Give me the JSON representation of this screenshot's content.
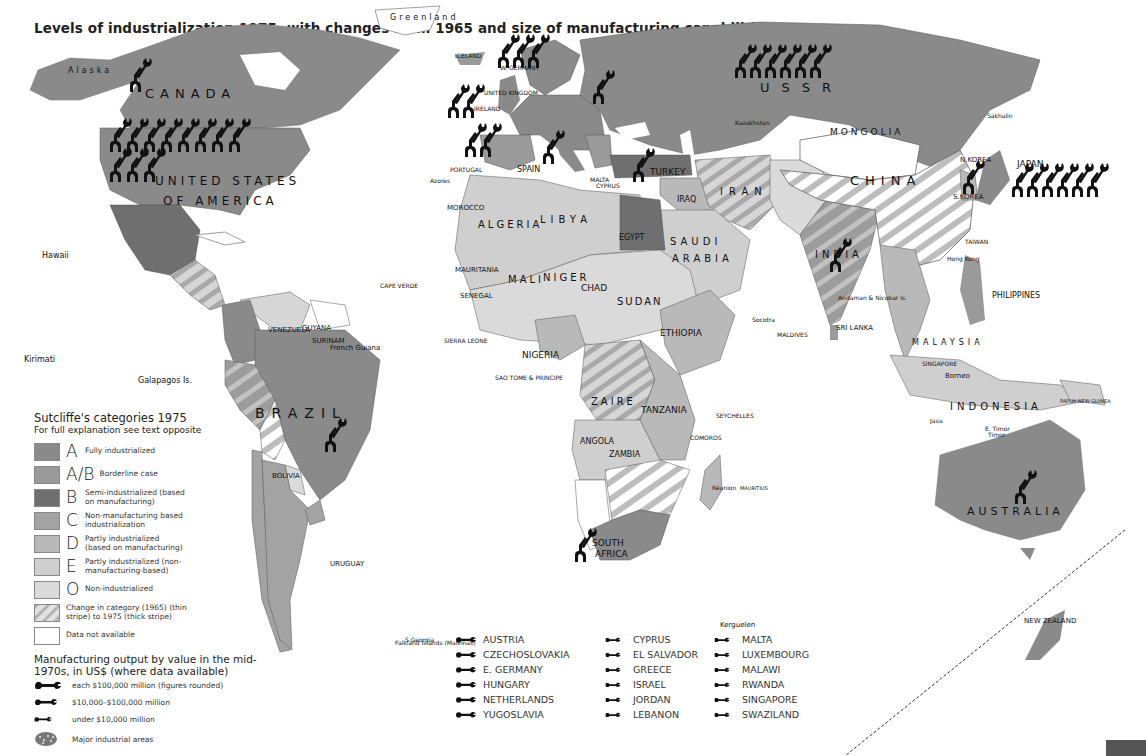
{
  "title": "Levels of industrialization 1975, with changes from 1965 and size of manufacturing capabilities",
  "colors": {
    "A": "#8a8a8a",
    "AB": "#9a9a9a",
    "B": "#6f6f6f",
    "C": "#a3a3a3",
    "D": "#b9b9b9",
    "E": "#cfcfcf",
    "O": "#dadada",
    "na": "#ffffff",
    "border": "#444444",
    "wrench": "#111111"
  },
  "map_labels": {
    "alaska": "Alaska",
    "canada": "CANADA",
    "greenland": "Greenland",
    "usa1": "UNITED STATES",
    "usa2": "OF AMERICA",
    "mexico": "MEXICO",
    "hawaii": "Hawaii",
    "kirimati": "Kirimati",
    "galapagos": "Galapagos Is.",
    "cuba": "CUBA",
    "bahamas": "BAHAMAS",
    "jamaica": "JAMAICA",
    "haiti": "HAITI",
    "dominican": "DOMINICAN REP.",
    "belize": "BELIZE",
    "honduras": "HONDURAS",
    "guatemala": "GUATEMALA",
    "el_salvador": "EL SALVADOR",
    "nicaragua": "NICARAGUA",
    "costa_rica": "COSTA RICA",
    "panama": "PANAMA",
    "virgin": "Virgin Is.",
    "antigua": "ANTIGUA & BARBUDA",
    "guadeloupe": "Guadeloupe",
    "dominica": "DOMINICA",
    "martinique": "Martinique",
    "st_lucia": "ST. LUCIA",
    "barbados": "BARBADOS",
    "st_vincent": "ST. VINCENT",
    "grenada": "GRENADA",
    "trinidad": "TRINIDAD & TOBAGO",
    "puerto_rico": "Puerto Rico",
    "venezuela": "VENEZUELA",
    "guyana": "GUYANA",
    "surinam": "SURINAM",
    "french_guiana": "French Guiana",
    "colombia": "COLOMBIA",
    "ecuador": "ECUADOR",
    "peru": "PERU",
    "brazil": "BRAZIL",
    "bolivia": "BOLIVIA",
    "paraguay": "PARAGUAY",
    "chile": "CHILE",
    "argentina": "ARGENTINA",
    "uruguay": "URUGUAY",
    "falklands": "Falkland Islands (Malvinas)",
    "s_georgia": "S.Georgia",
    "iceland": "ICELAND",
    "uk": "UNITED KINGDOM",
    "ireland": "IRELAND",
    "w_germany": "W. GERMANY",
    "norway": "NORWAY",
    "denmark": "DENMARK",
    "france": "FRANCE",
    "spain": "SPAIN",
    "portugal": "PORTUGAL",
    "italy": "ITALY",
    "greece": "GREECE",
    "malta": "MALTA",
    "cyprus": "CYPRUS",
    "azores": "Azores",
    "byelorussia": "Byelorussia",
    "ukraine": "Ukraine",
    "moldavia": "Moldavia",
    "ussr": "USSR",
    "kazakhstan": "Kazakhstan",
    "sakhalin": "Sakhalin",
    "mongolia": "MONGOLIA",
    "china": "CHINA",
    "n_korea": "N.KOREA",
    "s_korea": "S.KOREA",
    "japan": "JAPAN",
    "taiwan": "TAIWAN",
    "hong_kong": "Hong Kong",
    "turkey": "TURKEY",
    "syria": "SYRIA",
    "lebanon": "LEBANON",
    "israel": "ISRAEL",
    "jordan": "JORDAN",
    "iraq": "IRAQ",
    "iran": "IRAN",
    "kuwait": "KUWAIT",
    "bahrain": "BAHRAIN",
    "qatar": "QATAR",
    "saudi1": "SAUDI",
    "saudi2": "ARABIA",
    "oman": "OMAN",
    "yemen": "YEMEN",
    "afghanistan": "AFGHANISTAN",
    "pakistan": "PAKISTAN",
    "india": "INDIA",
    "nepal": "NEPAL",
    "bangladesh": "BANGLADESH",
    "myanmar": "MYANMAR",
    "thailand": "THAILAND",
    "vietnam": "VIETNAM",
    "cambodia": "CAMBODIA",
    "sri_lanka": "SRI LANKA",
    "maldives": "MALDIVES",
    "andaman": "Andaman & Nicobar Is.",
    "philippines": "PHILIPPINES",
    "malaysia": "MALAYSIA",
    "brunei": "BRUNEI",
    "singapore": "SINGAPORE",
    "borneo": "Borneo",
    "sumatra": "Sumatra",
    "java": "Java",
    "timor": "Timor",
    "e_timor": "E. Timor",
    "indonesia": "INDONESIA",
    "png": "PAPUA NEW GUINEA",
    "australia": "AUSTRALIA",
    "new_zealand": "NEW ZEALAND",
    "morocco": "MOROCCO",
    "canary": "Canary Isles",
    "w_sahara": "Western Sahara",
    "algeria": "ALGERIA",
    "libya": "LIBYA",
    "egypt": "EGYPT",
    "mauritania": "MAURITANIA",
    "mali": "MALI",
    "niger": "NIGER",
    "chad": "CHAD",
    "sudan": "SUDAN",
    "cape_verde": "CAPE VERDE",
    "senegal": "SENEGAL",
    "gambia": "GAMBIA",
    "guinea_bissau": "GUINEA BISSAU",
    "guinea": "GUINEA",
    "sierra_leone": "SIERRA LEONE",
    "liberia": "LIBERIA",
    "cote": "COTE D'IVOIRE",
    "ghana": "GHANA",
    "nigeria": "NIGERIA",
    "cameroon": "CAMEROON",
    "car": "CENTRAL AFRICAN REPUBLIC",
    "ethiopia": "ETHIOPIA",
    "eritrea": "Eritrea",
    "djibouti": "DJIBOUTI",
    "somalia": "SOMALIA",
    "socotra": "Socotra",
    "eq_guinea": "EQ. GUINEA",
    "sao_tome": "SAO TOME & PRINCIPE",
    "gabon": "GABON",
    "congo": "CONGO",
    "cabinda": "Cabinda",
    "zaire": "ZAIRE",
    "uganda": "UGANDA",
    "kenya": "KENYA",
    "rwanda": "RWANDA",
    "burundi": "BURUNDI",
    "tanzania": "TANZANIA",
    "seychelles": "SEYCHELLES",
    "angola": "ANGOLA",
    "zambia": "ZAMBIA",
    "malawi": "MALAWI",
    "comoros": "COMOROS",
    "mozambique": "MOZAMBIQUE",
    "zimbabwe": "ZIMBABWE",
    "namibia": "NAMIBIA",
    "botswana": "BOTSWANA",
    "madagascar": "MADAGASCAR",
    "reunion": "Réunion",
    "mauritius": "MAURITIUS",
    "swaziland": "SWAZILAND",
    "lesotho": "LESOTHO",
    "south_africa1": "SOUTH",
    "south_africa2": "AFRICA",
    "kerguelen": "Kerguelen"
  },
  "legend": {
    "heading": "Sutcliffe's categories 1975",
    "subheading": "For full explanation see text opposite",
    "categories": [
      {
        "key": "A",
        "letter": "A",
        "desc": "Fully industrialized"
      },
      {
        "key": "AB",
        "letter": "A/B",
        "desc": "Borderline case"
      },
      {
        "key": "B",
        "letter": "B",
        "desc": "Semi-industrialized (based on manufacturing)"
      },
      {
        "key": "C",
        "letter": "C",
        "desc": "Non-manufacturing based industrialization"
      },
      {
        "key": "D",
        "letter": "D",
        "desc": "Partly industrialized (based on manufacturing)"
      },
      {
        "key": "E",
        "letter": "E",
        "desc": "Partly industrialized (non-manufacturing-based)"
      },
      {
        "key": "O",
        "letter": "O",
        "desc": "Non-industrialized"
      },
      {
        "key": "change",
        "letter": "",
        "desc": "Change in category (1965) (thin stripe) to 1975 (thick stripe)"
      },
      {
        "key": "na",
        "letter": "",
        "desc": "Data not available"
      }
    ],
    "manufacturing_heading": "Manufacturing output by value in the mid-1970s, in US$ (where data available)",
    "manufacturing": [
      {
        "icon": "wrench-large",
        "desc": "each $100,000 million (figures rounded)"
      },
      {
        "icon": "wrench-medium",
        "desc": "$10,000–$100,000 million"
      },
      {
        "icon": "wrench-small",
        "desc": "under $10,000 million"
      },
      {
        "icon": "industrial-area",
        "desc": "Major industrial areas"
      }
    ]
  },
  "wrench_list": {
    "medium": [
      "AUSTRIA",
      "CZECHOSLOVAKIA",
      "E. GERMANY",
      "HUNGARY",
      "NETHERLANDS",
      "YUGOSLAVIA"
    ],
    "small_1": [
      "CYPRUS",
      "EL SALVADOR",
      "GREECE",
      "ISRAEL",
      "JORDAN",
      "LEBANON"
    ],
    "small_2": [
      "MALTA",
      "LUXEMBOURG",
      "MALAWI",
      "RWANDA",
      "SINGAPORE",
      "SWAZILAND"
    ]
  },
  "wrench_counts_large": {
    "usa": 13,
    "ussr": 6,
    "japan": 6,
    "w_germany": 3,
    "uk": 2,
    "france": 2,
    "canada": 1
  }
}
